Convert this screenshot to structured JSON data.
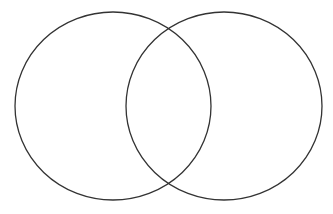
{
  "diagram": {
    "type": "venn",
    "sets": [
      {
        "id": "left",
        "label": "",
        "stroke": "#333333"
      },
      {
        "id": "right",
        "label": "",
        "stroke": "#333333"
      }
    ],
    "background": "#ffffff"
  }
}
